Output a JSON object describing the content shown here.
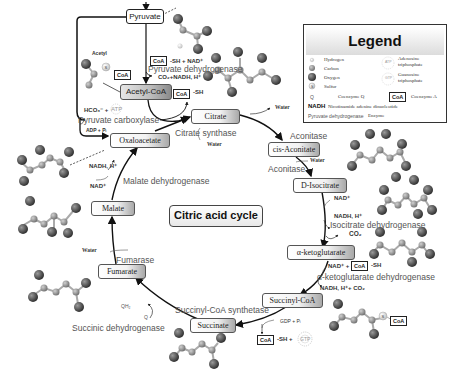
{
  "title": "Citric acid cycle",
  "legend": {
    "heading": "Legend",
    "items": [
      {
        "symbol": "hydrogen-atom",
        "label": "Hydrogen"
      },
      {
        "symbol": "carbon-atom",
        "label": "Carbon"
      },
      {
        "symbol": "oxygen-atom",
        "label": "Oxygen"
      },
      {
        "symbol": "sulfur-atom",
        "label": "Sulfur",
        "glyph": "S"
      },
      {
        "symbol": "Q",
        "label": "Coenzyme Q"
      },
      {
        "symbol": "ATP",
        "label": "Adenosine triphosphate",
        "line1": "Adenosine",
        "line2": "triphosphate"
      },
      {
        "symbol": "GTP",
        "label": "Guanosine triphosphate",
        "line1": "Guanosine",
        "line2": "triphosphate"
      },
      {
        "symbol": "CoA",
        "label": "Coenzyme A"
      },
      {
        "symbol": "NADH",
        "label": "Nicotinamide adenine dinucleotide"
      },
      {
        "symbol": "Pyruvate dehydrogenase",
        "label": "Enzyme"
      }
    ]
  },
  "metabolites": {
    "pyruvate": "Pyruvate",
    "acetyl_coa": "Acetyl-CoA",
    "citrate": "Citrate",
    "cis_aconitate": "cis-Aconitate",
    "d_isocitrate": "D-Isocitrate",
    "alpha_ketoglutarate": "α-ketoglutarate",
    "succinyl_coa": "Succinyl-CoA",
    "succinate": "Succinate",
    "fumarate": "Fumarate",
    "malate": "Malate",
    "oxaloacetate": "Oxaloacetate"
  },
  "enzymes": {
    "pyruvate_dehydrogenase": "Pyruvate dehydrogenase",
    "pyruvate_carboxylase": "Pyruvate carboxylase",
    "citrate_synthase": "Citrate synthase",
    "aconitase_1": "Aconitase",
    "aconitase_2": "Aconitase",
    "isocitrate_dehydrogenase": "Isocitrate dehydrogenase",
    "akg_dehydrogenase": "α-ketoglutarate dehydrogenase",
    "succinyl_coa_synthetase": "Succinyl-CoA synthetase",
    "succinic_dehydrogenase": "Succinic dehydrogenase",
    "fumarase": "Fumarase",
    "malate_dehydrogenase": "Malate dehydrogenase"
  },
  "cofactors": {
    "acetyl_label": "Acetyl",
    "coa": "CoA",
    "sh": "-SH",
    "sh_nad": "-SH + NAD⁺",
    "co2_nadh": "CO₂+NADH, H⁺",
    "hco3_atp": "HCO₃⁻ +",
    "atp": "ATP",
    "adp_pi": "ADP + Pᵢ",
    "water": "Water",
    "nad": "NAD⁺",
    "nadh_h": "NADH, H⁺",
    "co2": "CO₂",
    "nad_plus": "NAD⁺ +",
    "nadh_h_co2": "NADH, H⁺+ CO₂",
    "gdp_pi": "GDP + Pᵢ",
    "sh_plus": "-SH +",
    "gtp": "GTP",
    "qh2": "QH₂",
    "q": "Q",
    "s": "S"
  },
  "colors": {
    "atom_oxygen": "#3a3a3a",
    "atom_carbon": "#8a8a8a",
    "atom_hydrogen": "#d8d8d8",
    "enzyme_text": "#555555",
    "arrow": "#111111"
  }
}
